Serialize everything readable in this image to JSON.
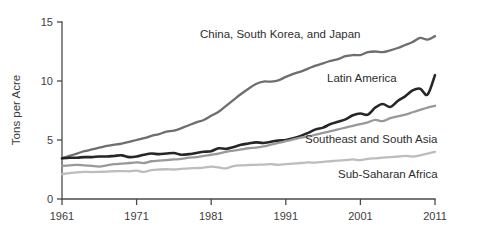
{
  "chart_data": {
    "type": "line",
    "title": "",
    "subtitle": "",
    "xlabel": "",
    "ylabel": "Tons per Acre",
    "xlim": [
      1961,
      2011
    ],
    "ylim": [
      0,
      15
    ],
    "grid": false,
    "legend_position": "inline-annotations",
    "xticks": [
      1961,
      1971,
      1981,
      1991,
      2001,
      2011
    ],
    "xtick_labels": [
      "1961",
      "1971",
      "1981",
      "1991",
      "2001",
      "2011"
    ],
    "yticks": [
      0,
      5,
      10,
      15
    ],
    "ytick_labels": [
      "0",
      "5",
      "10",
      "15"
    ],
    "x": [
      1961,
      1962,
      1963,
      1964,
      1965,
      1966,
      1967,
      1968,
      1969,
      1970,
      1971,
      1972,
      1973,
      1974,
      1975,
      1976,
      1977,
      1978,
      1979,
      1980,
      1981,
      1982,
      1983,
      1984,
      1985,
      1986,
      1987,
      1988,
      1989,
      1990,
      1991,
      1992,
      1993,
      1994,
      1995,
      1996,
      1997,
      1998,
      1999,
      2000,
      2001,
      2002,
      2003,
      2004,
      2005,
      2006,
      2007,
      2008,
      2009,
      2010,
      2011
    ],
    "series": [
      {
        "name": "China, South Korea, and Japan",
        "color": "#6e6e6e",
        "label_position": {
          "x": 200,
          "y": 38
        },
        "values": [
          3.45,
          3.65,
          3.85,
          4.05,
          4.2,
          4.35,
          4.5,
          4.6,
          4.7,
          4.85,
          5.0,
          5.15,
          5.35,
          5.5,
          5.7,
          5.8,
          6.0,
          6.25,
          6.5,
          6.7,
          7.05,
          7.4,
          7.9,
          8.4,
          8.9,
          9.35,
          9.75,
          9.95,
          9.95,
          10.05,
          10.35,
          10.6,
          10.8,
          11.05,
          11.3,
          11.5,
          11.7,
          11.85,
          12.1,
          12.2,
          12.2,
          12.45,
          12.5,
          12.45,
          12.6,
          12.8,
          13.05,
          13.3,
          13.65,
          13.5,
          13.8
        ]
      },
      {
        "name": "Latin America",
        "color": "#262626",
        "label_position": {
          "x": 327,
          "y": 82
        },
        "values": [
          3.45,
          3.5,
          3.5,
          3.55,
          3.55,
          3.6,
          3.6,
          3.65,
          3.7,
          3.55,
          3.6,
          3.75,
          3.85,
          3.8,
          3.85,
          3.9,
          3.75,
          3.8,
          3.9,
          4.0,
          4.05,
          4.3,
          4.25,
          4.4,
          4.6,
          4.7,
          4.8,
          4.75,
          4.85,
          4.95,
          5.0,
          5.15,
          5.35,
          5.6,
          5.9,
          6.05,
          6.35,
          6.55,
          6.75,
          7.1,
          7.25,
          7.15,
          7.75,
          8.05,
          7.8,
          8.3,
          8.7,
          9.2,
          9.35,
          8.85,
          10.5
        ]
      },
      {
        "name": "Southeast and South Asia",
        "color": "#999999",
        "label_position": {
          "x": 305,
          "y": 143
        },
        "values": [
          2.8,
          2.85,
          2.9,
          2.85,
          2.8,
          2.75,
          2.85,
          2.95,
          3.0,
          3.05,
          3.1,
          3.05,
          3.2,
          3.25,
          3.3,
          3.35,
          3.4,
          3.5,
          3.55,
          3.65,
          3.75,
          3.85,
          4.0,
          4.1,
          4.2,
          4.3,
          4.35,
          4.45,
          4.6,
          4.75,
          4.9,
          5.05,
          5.2,
          5.3,
          5.45,
          5.6,
          5.75,
          5.9,
          6.05,
          6.2,
          6.35,
          6.5,
          6.7,
          6.6,
          6.85,
          7.0,
          7.15,
          7.35,
          7.55,
          7.75,
          7.9
        ]
      },
      {
        "name": "Sub-Saharan Africa",
        "color": "#bdbdbd",
        "label_position": {
          "x": 338,
          "y": 178
        },
        "values": [
          2.1,
          2.2,
          2.25,
          2.3,
          2.28,
          2.3,
          2.32,
          2.35,
          2.37,
          2.35,
          2.4,
          2.3,
          2.45,
          2.5,
          2.52,
          2.5,
          2.55,
          2.6,
          2.62,
          2.65,
          2.75,
          2.68,
          2.6,
          2.78,
          2.85,
          2.88,
          2.9,
          2.92,
          2.95,
          2.9,
          2.95,
          3.0,
          3.05,
          3.1,
          3.08,
          3.15,
          3.2,
          3.25,
          3.3,
          3.35,
          3.3,
          3.4,
          3.45,
          3.5,
          3.55,
          3.6,
          3.65,
          3.6,
          3.7,
          3.85,
          4.0
        ]
      }
    ]
  }
}
